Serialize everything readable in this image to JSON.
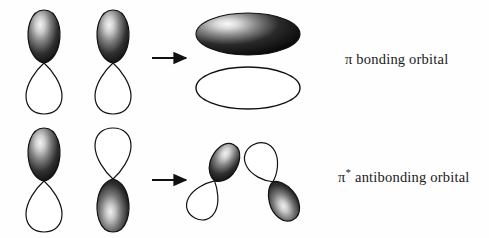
{
  "figure": {
    "type": "diagram",
    "background_color": "#fefefe",
    "ink_color": "#1a1a1a"
  },
  "rows": [
    {
      "id": "bonding-row",
      "name": "pi-bonding-row",
      "description": "Two in-phase p orbitals combine to form a pi bonding orbital",
      "label": {
        "symbol": "π",
        "superscript": "",
        "text": " bonding orbital",
        "full": "π bonding orbital"
      },
      "reactants": [
        {
          "name": "p-orbital-left",
          "orientation": "vertical",
          "top_lobe": "dark",
          "bottom_lobe": "white"
        },
        {
          "name": "p-orbital-right",
          "orientation": "vertical",
          "top_lobe": "dark",
          "bottom_lobe": "white"
        }
      ],
      "arrow": {
        "name": "reaction-arrow",
        "direction": "right"
      },
      "product": {
        "name": "pi-bonding-orbital",
        "shape": "two stacked ellipses",
        "upper_lobe": "dark",
        "lower_lobe": "white"
      }
    },
    {
      "id": "antibonding-row",
      "name": "pi-antibonding-row",
      "description": "Two out-of-phase p orbitals combine to form a pi antibonding orbital",
      "label": {
        "symbol": "π",
        "superscript": "*",
        "text": " antibonding orbital",
        "full": "π* antibonding orbital"
      },
      "reactants": [
        {
          "name": "p-orbital-left",
          "orientation": "vertical",
          "top_lobe": "dark",
          "bottom_lobe": "white"
        },
        {
          "name": "p-orbital-right",
          "orientation": "vertical",
          "top_lobe": "white",
          "bottom_lobe": "dark"
        }
      ],
      "arrow": {
        "name": "reaction-arrow",
        "direction": "right"
      },
      "product": {
        "name": "pi-antibonding-orbital",
        "shape": "two tilted mirrored p orbitals with node between",
        "left_lobe_upper": "dark",
        "left_lobe_lower": "white",
        "right_lobe_upper": "white",
        "right_lobe_lower": "dark"
      }
    }
  ]
}
